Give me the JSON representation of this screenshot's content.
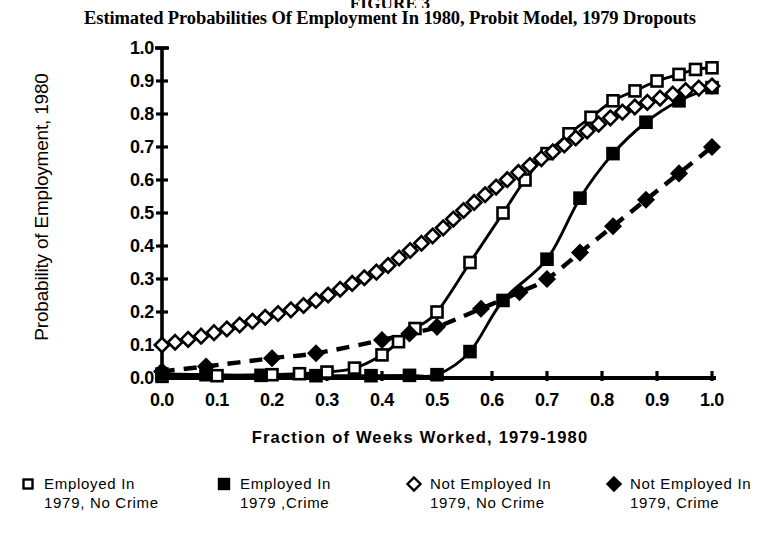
{
  "figure": {
    "number": "FIGURE 3",
    "title": "Estimated Probabilities Of Employment In 1980, Probit Model, 1979 Dropouts"
  },
  "axes": {
    "ylabel": "Probability of Employment, 1980",
    "xlabel": "Fraction of Weeks Worked, 1979-1980",
    "yticks": [
      "1.0",
      "0.9",
      "0.8",
      "0.7",
      "0.6",
      "0.5",
      "0.4",
      "0.3",
      "0.2",
      "0.1",
      "0.0"
    ],
    "xticks": [
      "0.0",
      "0.1",
      "0.2",
      "0.3",
      "0.4",
      "0.5",
      "0.6",
      "0.7",
      "0.8",
      "0.9",
      "1.0"
    ]
  },
  "legend": [
    {
      "marker": "open-square",
      "label": "Employed In\n1979, No Crime"
    },
    {
      "marker": "filled-square",
      "label": "Employed In\n1979 ,Crime"
    },
    {
      "marker": "open-diamond",
      "label": "Not Employed In\n1979, No Crime"
    },
    {
      "marker": "filled-diamond",
      "label": "Not Employed In\n1979, Crime"
    }
  ],
  "colors": {
    "ink": "#000000",
    "paper": "#ffffff"
  },
  "chart_data": {
    "type": "line",
    "title": "Estimated Probabilities Of Employment In 1980, Probit Model, 1979 Dropouts",
    "xlabel": "Fraction of Weeks Worked, 1979-1980",
    "ylabel": "Probability of Employment, 1980",
    "xlim": [
      0.0,
      1.0
    ],
    "ylim": [
      0.0,
      1.0
    ],
    "grid": false,
    "legend_position": "below-plot",
    "series": [
      {
        "name": "Employed In 1979, No Crime",
        "marker": "open-square",
        "line": "solid",
        "x": [
          0.0,
          0.1,
          0.2,
          0.25,
          0.3,
          0.35,
          0.4,
          0.43,
          0.46,
          0.5,
          0.56,
          0.62,
          0.66,
          0.7,
          0.74,
          0.78,
          0.82,
          0.86,
          0.9,
          0.94,
          0.97,
          1.0
        ],
        "y": [
          0.005,
          0.007,
          0.01,
          0.013,
          0.018,
          0.03,
          0.07,
          0.11,
          0.15,
          0.2,
          0.35,
          0.5,
          0.6,
          0.68,
          0.74,
          0.79,
          0.84,
          0.87,
          0.9,
          0.92,
          0.935,
          0.94
        ]
      },
      {
        "name": "Employed In 1979 ,Crime",
        "marker": "filled-square",
        "line": "solid",
        "x": [
          0.0,
          0.08,
          0.18,
          0.28,
          0.38,
          0.45,
          0.5,
          0.56,
          0.62,
          0.7,
          0.76,
          0.82,
          0.88,
          0.94,
          1.0
        ],
        "y": [
          0.012,
          0.01,
          0.008,
          0.007,
          0.007,
          0.008,
          0.01,
          0.08,
          0.235,
          0.36,
          0.545,
          0.68,
          0.775,
          0.84,
          0.88
        ]
      },
      {
        "name": "Not Employed In 1979, No Crime",
        "marker": "open-diamond",
        "line": "dashed",
        "x": [
          0.0,
          0.05,
          0.1,
          0.15,
          0.2,
          0.25,
          0.3,
          0.35,
          0.4,
          0.45,
          0.5,
          0.55,
          0.6,
          0.65,
          0.7,
          0.75,
          0.8,
          0.85,
          0.9,
          0.95,
          1.0
        ],
        "y": [
          0.1,
          0.118,
          0.14,
          0.165,
          0.19,
          0.215,
          0.25,
          0.29,
          0.33,
          0.385,
          0.44,
          0.51,
          0.57,
          0.625,
          0.675,
          0.725,
          0.775,
          0.815,
          0.845,
          0.87,
          0.885
        ]
      },
      {
        "name": "Not Employed In 1979, Crime",
        "marker": "filled-diamond",
        "line": "dashed",
        "x": [
          0.0,
          0.08,
          0.2,
          0.28,
          0.4,
          0.45,
          0.5,
          0.58,
          0.65,
          0.7,
          0.76,
          0.82,
          0.88,
          0.94,
          1.0
        ],
        "y": [
          0.02,
          0.035,
          0.06,
          0.075,
          0.115,
          0.135,
          0.155,
          0.21,
          0.26,
          0.3,
          0.38,
          0.46,
          0.54,
          0.62,
          0.7
        ]
      }
    ]
  }
}
